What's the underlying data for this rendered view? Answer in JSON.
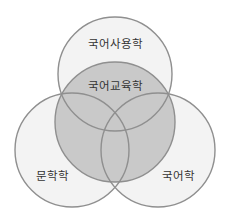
{
  "diagram": {
    "type": "venn",
    "colors": {
      "background": "#ffffff",
      "outer_fill": "#f3f3f3",
      "center_fill": "#b9b9b9",
      "stroke": "#8f8f8f",
      "text": "#333333"
    },
    "circles": [
      {
        "id": "top",
        "label": "국어사용학",
        "cx": 115,
        "cy": 74,
        "r": 57,
        "label_x": 115,
        "label_y": 44
      },
      {
        "id": "left",
        "label": "문학학",
        "cx": 72,
        "cy": 150,
        "r": 57,
        "label_x": 52,
        "label_y": 176
      },
      {
        "id": "right",
        "label": "국어학",
        "cx": 158,
        "cy": 150,
        "r": 57,
        "label_x": 178,
        "label_y": 176
      },
      {
        "id": "center",
        "label": "국어교육학",
        "cx": 115,
        "cy": 122,
        "r": 60,
        "label_x": 115,
        "label_y": 86
      }
    ]
  }
}
